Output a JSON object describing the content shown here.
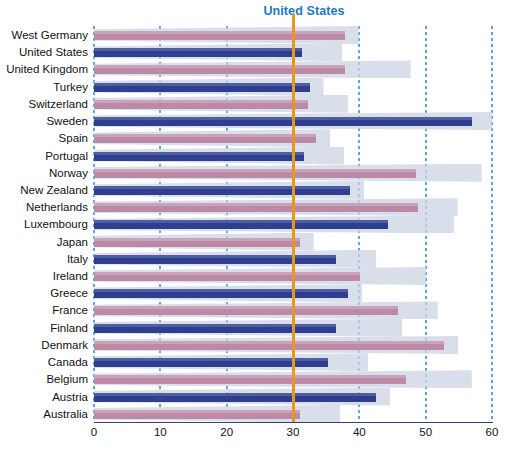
{
  "chart_data": {
    "type": "bar",
    "orientation": "horizontal",
    "title": "",
    "xlabel": "",
    "ylabel": "",
    "xlim": [
      0,
      60
    ],
    "xticks": [
      0,
      10,
      20,
      30,
      40,
      50,
      60
    ],
    "grid": "vertical dotted gridlines at every x tick",
    "legend": null,
    "reference_line": {
      "label": "United States",
      "value": 30,
      "color": "#e8961e"
    },
    "colors": {
      "bar_blue": "#2e3f8f",
      "bar_rose": "#bb8aa6",
      "wedge": "#ccd3e4",
      "gridline": "#59a9dd",
      "reference": "#e8961e",
      "reference_label": "#1b79c0"
    },
    "categories": [
      "West Germany",
      "United States",
      "United Kingdom",
      "Turkey",
      "Switzerland",
      "Sweden",
      "Spain",
      "Portugal",
      "Norway",
      "New Zealand",
      "Netherlands",
      "Luxembourg",
      "Japan",
      "Italy",
      "Ireland",
      "Greece",
      "France",
      "Finland",
      "Denmark",
      "Canada",
      "Belgium",
      "Austria",
      "Australia"
    ],
    "values": [
      37.8,
      31.4,
      37.8,
      32.5,
      32.3,
      57.0,
      33.5,
      31.7,
      48.5,
      38.6,
      48.8,
      44.3,
      31.0,
      36.5,
      40.1,
      38.3,
      45.8,
      36.5,
      52.8,
      35.3,
      47.0,
      42.5,
      31.1
    ],
    "series_colors": [
      "rose",
      "blue",
      "rose",
      "blue",
      "rose",
      "blue",
      "rose",
      "blue",
      "rose",
      "blue",
      "rose",
      "blue",
      "rose",
      "blue",
      "rose",
      "blue",
      "rose",
      "blue",
      "rose",
      "blue",
      "rose",
      "blue",
      "rose"
    ]
  }
}
